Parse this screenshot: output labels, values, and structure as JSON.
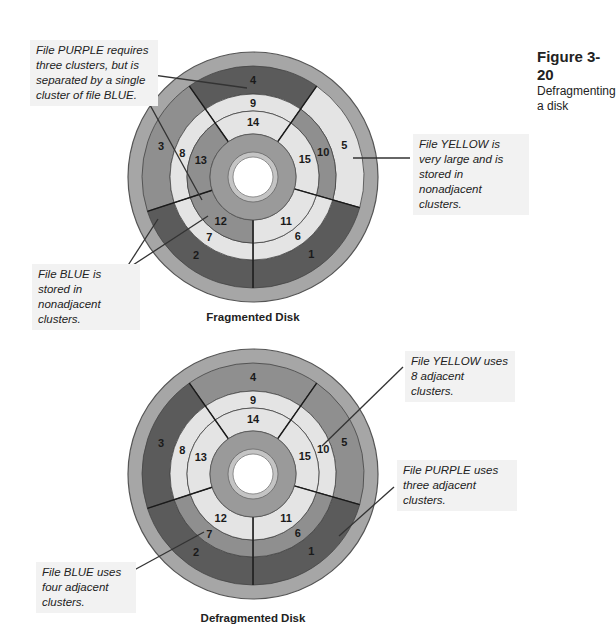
{
  "figure": {
    "number": "Figure 3-20",
    "caption": "Defragmenting a disk"
  },
  "colors": {
    "rim": "#a6a6a6",
    "rim_stroke": "#555555",
    "purple_dark": "#5b5b5b",
    "blue_mid": "#8f8f8f",
    "yellow_light": "#e4e4e4",
    "hub": "#9a9a9a",
    "hub_ring": "#c4c4c4",
    "hole": "#ffffff",
    "callout_bg": "#f2f2f2"
  },
  "fragmented": {
    "caption": "Fragmented Disk",
    "callouts": {
      "purple": "File PURPLE requires three clusters, but is separated by a single cluster of file BLUE.",
      "yellow": "File YELLOW is very large and is stored in nonadjacent clusters.",
      "blue": "File BLUE is stored in nonadjacent clusters."
    },
    "clusters": {
      "1": "purple",
      "2": "purple",
      "3": "blue",
      "4": "purple",
      "5": "yellow",
      "6": "yellow",
      "7": "yellow",
      "8": "yellow",
      "9": "yellow",
      "10": "blue",
      "11": "yellow",
      "12": "blue",
      "13": "blue",
      "14": "yellow",
      "15": "yellow"
    }
  },
  "defragmented": {
    "caption": "Defragmented Disk",
    "callouts": {
      "yellow": "File YELLOW uses 8 adjacent clusters.",
      "purple": "File PURPLE uses three adjacent clusters.",
      "blue": "File BLUE uses four adjacent clusters."
    },
    "clusters": {
      "1": "purple",
      "2": "purple",
      "3": "purple",
      "4": "blue",
      "5": "blue",
      "6": "blue",
      "7": "blue",
      "8": "yellow",
      "9": "yellow",
      "10": "yellow",
      "11": "yellow",
      "12": "yellow",
      "13": "yellow",
      "14": "yellow",
      "15": "yellow"
    }
  },
  "cluster_labels": [
    "1",
    "2",
    "3",
    "4",
    "5",
    "6",
    "7",
    "8",
    "9",
    "10",
    "11",
    "12",
    "13",
    "14",
    "15"
  ]
}
